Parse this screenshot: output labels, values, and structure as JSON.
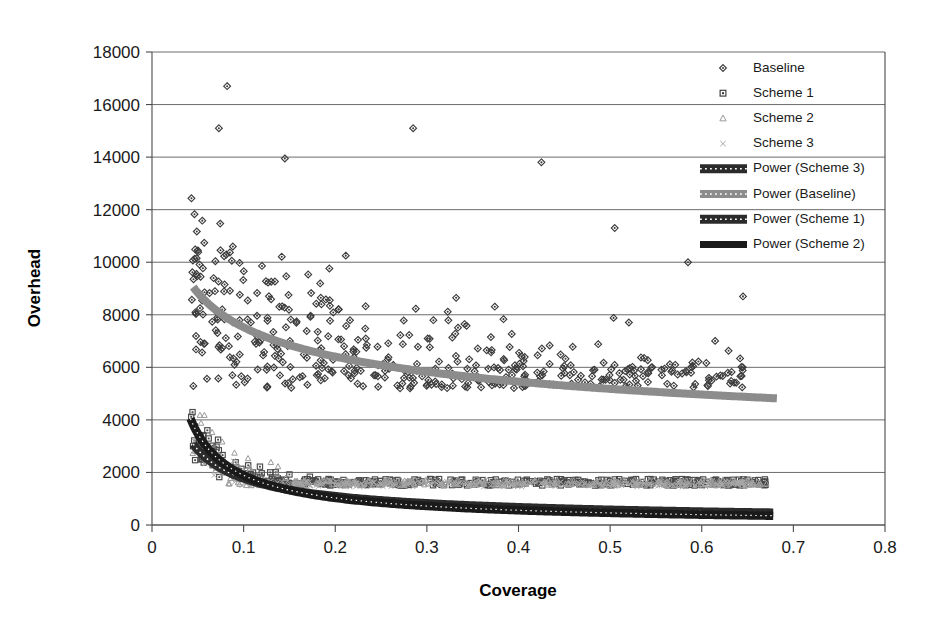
{
  "chart_data": {
    "type": "scatter",
    "title": "",
    "xlabel": "Coverage",
    "ylabel": "Overhead",
    "xlim": [
      0,
      0.8
    ],
    "ylim": [
      0,
      18000
    ],
    "xticks": [
      "0",
      "0.1",
      "0.2",
      "0.3",
      "0.4",
      "0.5",
      "0.6",
      "0.7",
      "0.8"
    ],
    "xtick_values": [
      0,
      0.1,
      0.2,
      0.3,
      0.4,
      0.5,
      0.6,
      0.7,
      0.8
    ],
    "yticks": [
      "0",
      "2000",
      "4000",
      "6000",
      "8000",
      "10000",
      "12000",
      "14000",
      "16000",
      "18000"
    ],
    "ytick_values": [
      0,
      2000,
      4000,
      6000,
      8000,
      10000,
      12000,
      14000,
      16000,
      18000
    ],
    "grid": "horizontal",
    "legend_position": "top-right",
    "legend": [
      {
        "label": "Baseline",
        "type": "marker",
        "marker": "diamond",
        "color": "#3b3b3b"
      },
      {
        "label": "Scheme 1",
        "type": "marker",
        "marker": "square",
        "color": "#3b3b3b"
      },
      {
        "label": "Scheme 2",
        "type": "marker",
        "marker": "triangle",
        "color": "#9a9a9a"
      },
      {
        "label": "Scheme 3",
        "type": "marker",
        "marker": "cross",
        "color": "#a8a8a8"
      },
      {
        "label": "Power (Scheme 3)",
        "type": "line",
        "style": "textured",
        "color": "#2b2b2b",
        "width": 9
      },
      {
        "label": "Power (Baseline)",
        "type": "line",
        "style": "textured",
        "color": "#8c8c8c",
        "width": 8
      },
      {
        "label": "Power (Scheme 1)",
        "type": "line",
        "style": "textured",
        "color": "#2b2b2b",
        "width": 9
      },
      {
        "label": "Power (Scheme 2)",
        "type": "line",
        "style": "solid",
        "color": "#1a1a1a",
        "width": 7
      }
    ],
    "series": [
      {
        "name": "Baseline",
        "marker": "diamond",
        "color": "#3b3b3b",
        "point_count": 430,
        "x_range": [
          0.042,
          0.645
        ],
        "y_range": [
          5400,
          16700
        ],
        "trend": {
          "name": "Power (Baseline)",
          "form": "y = a * x^b",
          "a": 4410,
          "b": -0.232,
          "x_start": 0.045,
          "x_end": 0.682,
          "y_start": 9500,
          "y_end": 7980,
          "color": "#8c8c8c"
        },
        "notable_points": [
          {
            "x": 0.082,
            "y": 16700
          },
          {
            "x": 0.073,
            "y": 15100
          },
          {
            "x": 0.285,
            "y": 15100
          },
          {
            "x": 0.145,
            "y": 13950
          },
          {
            "x": 0.425,
            "y": 13800
          },
          {
            "x": 0.505,
            "y": 11300
          },
          {
            "x": 0.585,
            "y": 10000
          },
          {
            "x": 0.645,
            "y": 8700
          }
        ]
      },
      {
        "name": "Scheme 1",
        "marker": "square",
        "color": "#4a4a4a",
        "point_count": 380,
        "x_range": [
          0.042,
          0.672
        ],
        "y_range": [
          1500,
          12200
        ],
        "trend": {
          "name": "Power (Scheme 1)",
          "form": "y = a * x^b",
          "a": 358,
          "b": -0.694,
          "x_start": 0.045,
          "x_end": 0.678,
          "y_start": 7400,
          "y_end": 1560,
          "color": "#2b2b2b"
        }
      },
      {
        "name": "Scheme 2",
        "marker": "triangle",
        "color": "#9a9a9a",
        "point_count": 300,
        "x_range": [
          0.042,
          0.672
        ],
        "y_range": [
          1500,
          11500
        ],
        "trend": {
          "name": "Power (Scheme 2)",
          "form": "y = a * x^b",
          "a": 251,
          "b": -0.877,
          "x_start": 0.042,
          "x_end": 0.678,
          "y_start": 11200,
          "y_end": 1640,
          "color": "#1a1a1a"
        }
      },
      {
        "name": "Scheme 3",
        "marker": "cross",
        "color": "#a8a8a8",
        "point_count": 260,
        "x_range": [
          0.042,
          0.655
        ],
        "y_range": [
          1450,
          9000
        ],
        "trend": {
          "name": "Power (Scheme 3)",
          "form": "y = a * x^b",
          "a": 251,
          "b": -0.877,
          "x_start": 0.042,
          "x_end": 0.678,
          "y_start": 11200,
          "y_end": 1640,
          "color": "#2b2b2b"
        }
      }
    ]
  }
}
